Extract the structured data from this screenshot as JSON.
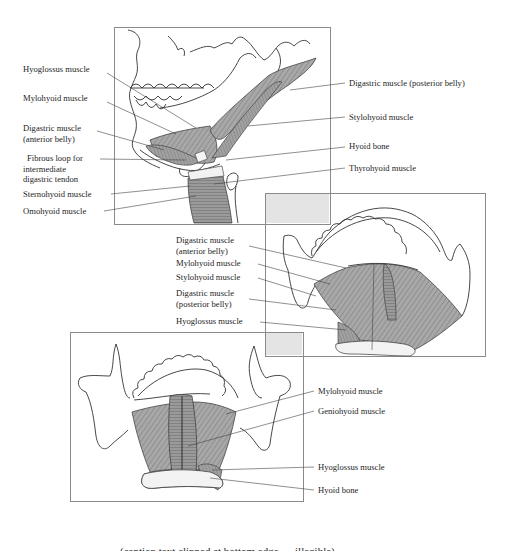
{
  "figures": {
    "lateral_view": {
      "labels_left": [
        {
          "text": "Hyoglossus muscle"
        },
        {
          "text": "Mylohyoid muscle"
        },
        {
          "text": "Digastric muscle",
          "text2": "(anterior belly)"
        },
        {
          "text": "Fibrous loop for",
          "text2": "intermediate",
          "text3": "digastric tendon"
        },
        {
          "text": "Sternohyoid muscle"
        },
        {
          "text": "Omohyoid muscle"
        }
      ],
      "labels_right": [
        {
          "text": "Digastric muscle (posterior belly)"
        },
        {
          "text": "Stylohyoid muscle"
        },
        {
          "text": "Hyoid bone"
        },
        {
          "text": "Thyrohyoid muscle"
        }
      ]
    },
    "inferior_view": {
      "labels_left": [
        {
          "text": "Digastric muscle",
          "text2": "(anterior belly)"
        },
        {
          "text": "Mylohyoid muscle"
        },
        {
          "text": "Stylohyoid muscle"
        },
        {
          "text": "Digastric muscle",
          "text2": "(posterior belly)"
        },
        {
          "text": "Hyoglossus muscle"
        }
      ]
    },
    "superior_view": {
      "labels_right": [
        {
          "text": "Mylohyoid muscle"
        },
        {
          "text": "Geniohyoid  muscle"
        },
        {
          "text": "Hyoglossus muscle"
        },
        {
          "text": "Hyoid bone"
        }
      ]
    }
  },
  "caption": {
    "text": "(caption text clipped at bottom edge — illegible)"
  },
  "colors": {
    "frame_border": "#8a8a8a",
    "overlap_fill": "#e4e4e4",
    "muscle_fill": "#9c9c9c",
    "line": "#333333"
  }
}
